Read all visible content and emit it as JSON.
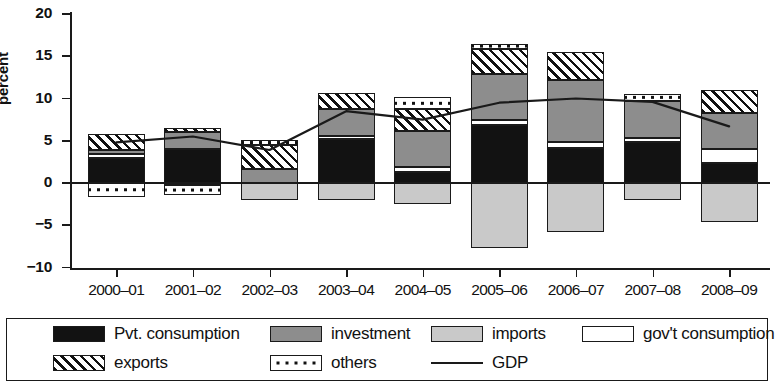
{
  "chart_data": {
    "type": "bar",
    "title": "",
    "subtitle": "",
    "xlabel": "",
    "ylabel": "percent",
    "stacked": true,
    "grid": false,
    "legend_position": "bottom",
    "ylim": [
      -10,
      20
    ],
    "yticks": [
      20,
      15,
      10,
      5,
      0,
      -5,
      -10
    ],
    "ytick_labels": [
      "20",
      "15",
      "10",
      "5",
      "0",
      "−5",
      "−10"
    ],
    "categories": [
      "2000–01",
      "2001–02",
      "2002–03",
      "2003–04",
      "2004–05",
      "2005–06",
      "2006–07",
      "2007–08",
      "2008–09"
    ],
    "series": [
      {
        "name": "Pvt. consumption",
        "key": "pvt",
        "fill": "solid-black",
        "color": "#121212",
        "values": [
          2.9,
          4.0,
          0.0,
          5.2,
          1.3,
          6.9,
          4.2,
          4.8,
          2.4
        ]
      },
      {
        "name": "investment",
        "key": "inv",
        "fill": "dark-gray-stipple",
        "color": "#8d8d8d",
        "values": [
          0.5,
          2.0,
          1.6,
          3.2,
          4.2,
          5.5,
          7.4,
          4.4,
          4.3
        ]
      },
      {
        "name": "imports",
        "key": "imp",
        "fill": "light-gray-stipple",
        "color": "#c9c9c9",
        "values": [
          0.0,
          0.0,
          -2.0,
          -2.0,
          -2.5,
          -7.7,
          -5.8,
          -2.0,
          -4.6
        ]
      },
      {
        "name": "gov't consumption",
        "key": "gov",
        "fill": "white",
        "color": "#ffffff",
        "values": [
          0.5,
          -0.2,
          0.0,
          0.4,
          0.6,
          0.5,
          0.6,
          0.5,
          1.6
        ]
      },
      {
        "name": "exports",
        "key": "exp",
        "fill": "diagonal-hatch",
        "color": "#ffffff",
        "values": [
          1.9,
          0.5,
          2.9,
          1.8,
          2.6,
          3.0,
          3.3,
          0.0,
          2.7
        ]
      },
      {
        "name": "others",
        "key": "oth",
        "fill": "dotted",
        "color": "#ffffff",
        "values": [
          -1.6,
          -1.2,
          0.6,
          0.0,
          1.5,
          0.5,
          0.0,
          0.8,
          0.0
        ]
      }
    ],
    "line_series": {
      "name": "GDP",
      "color": "#1a1a1a",
      "values": [
        4.8,
        5.5,
        3.9,
        8.5,
        7.5,
        9.5,
        10.0,
        9.6,
        6.7
      ]
    }
  },
  "axis": {
    "y_title": "percent",
    "ticks": [
      {
        "label": "20",
        "value": 20
      },
      {
        "label": "15",
        "value": 15
      },
      {
        "label": "10",
        "value": 10
      },
      {
        "label": "5",
        "value": 5
      },
      {
        "label": "0",
        "value": 0
      },
      {
        "label": "−5",
        "value": -5
      },
      {
        "label": "−10",
        "value": -10
      }
    ]
  },
  "legend": {
    "row1": [
      {
        "label": "Pvt. consumption",
        "swatch": "solid-black-swatch"
      },
      {
        "label": "investment",
        "swatch": "dark-gray-swatch"
      },
      {
        "label": "imports",
        "swatch": "light-gray-swatch"
      },
      {
        "label": "gov't consumption",
        "swatch": "white-swatch"
      }
    ],
    "row2": [
      {
        "label": "exports",
        "swatch": "hatch-swatch"
      },
      {
        "label": "others",
        "swatch": "dotted-swatch"
      },
      {
        "label": "GDP",
        "swatch": "line-swatch"
      }
    ]
  }
}
